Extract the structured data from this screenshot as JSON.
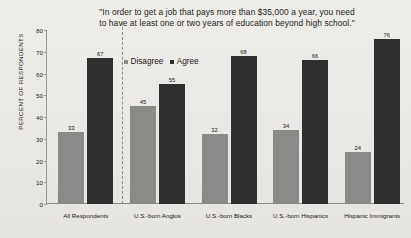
{
  "chart_data": {
    "type": "bar",
    "title": "\"In order to get a job that pays more than $35,000 a year, you need to have at least one or two years of education beyond high school.\"",
    "title_lines": [
      "\"In order to get a job that pays more than $35,000 a year, you need",
      "to have at least one or two years of education beyond high school.\""
    ],
    "xlabel": "",
    "ylabel": "PERCENT OF RESPONDENTS",
    "ylim": [
      0,
      80
    ],
    "yticks": [
      0,
      10,
      20,
      30,
      40,
      50,
      60,
      70,
      80
    ],
    "grid": false,
    "legend_position": "inside-top-left",
    "categories": [
      "All Respondents",
      "U.S.-born Anglos",
      "U.S.-born Blacks",
      "U.S.-born Hispanics",
      "Hispanic Immigrants"
    ],
    "series": [
      {
        "name": "Disagree",
        "color": "#8b8a88",
        "values": [
          33,
          45,
          32,
          34,
          24
        ]
      },
      {
        "name": "Agree",
        "color": "#2f2f30",
        "values": [
          67,
          55,
          68,
          66,
          76
        ]
      }
    ],
    "annotations": {
      "divider_after_category": "All Respondents",
      "divider_style": "dashed-vertical"
    }
  },
  "colors": {
    "background": "#eceae6",
    "disagree": "#8b8a88",
    "agree": "#2f2f30",
    "axis": "#8e8c87",
    "text": "#18181a"
  }
}
